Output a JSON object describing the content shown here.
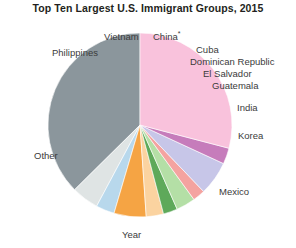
{
  "chart_data": {
    "type": "pie",
    "title": "Top Ten Largest U.S. Immigrant Groups, 2015",
    "xlabel": "Year",
    "ylabel": "",
    "legend_position": "none",
    "grid": false,
    "labels_outside": true,
    "start_angle_deg": 180,
    "direction": "clockwise",
    "categories": [
      "Other",
      "Philippines",
      "Vietnam",
      "China*",
      "Cuba",
      "Dominican Republic",
      "El Salvador",
      "Guatemala",
      "India",
      "Korea",
      "Mexico"
    ],
    "values": [
      34.5,
      4.4,
      3.0,
      5.2,
      2.8,
      2.3,
      3.1,
      2.0,
      5.5,
      2.6,
      26.8
    ],
    "colors": [
      "#8b969c",
      "#dfe4e4",
      "#b8d8ec",
      "#f5a444",
      "#fbd3a0",
      "#5ea95a",
      "#b4dfa6",
      "#f4a3a0",
      "#c7c6e8",
      "#c67cbb",
      "#f9c2dc"
    ]
  },
  "labels": {
    "other": "Other",
    "philippines": "Philippines",
    "vietnam": "Vietnam",
    "china": "China",
    "china_asterisk": "*",
    "cuba": "Cuba",
    "dominican_republic": "Dominican Republic",
    "el_salvador": "El Salvador",
    "guatemala": "Guatemala",
    "india": "India",
    "korea": "Korea",
    "mexico": "Mexico",
    "year_axis": "Year"
  }
}
